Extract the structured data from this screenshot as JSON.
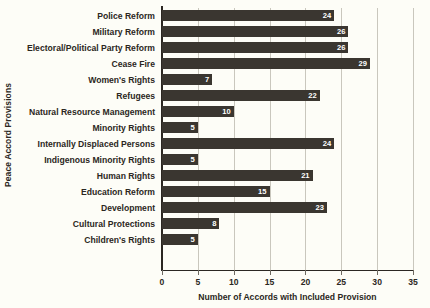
{
  "chart_data": {
    "type": "bar",
    "orientation": "horizontal",
    "title": "",
    "xlabel": "Number of Accords with Included Provision",
    "ylabel": "Peace Accord Provisions",
    "xlim": [
      0,
      35
    ],
    "xticks": [
      0,
      5,
      10,
      15,
      20,
      25,
      30,
      35
    ],
    "grid": true,
    "legend": false,
    "bar_color": "#3a3630",
    "background_color": "#fdfdf7",
    "value_label_color": "#ffffff",
    "categories": [
      "Police Reform",
      "Military Reform",
      "Electoral/Political Party Reform",
      "Cease Fire",
      "Women's Rights",
      "Refugees",
      "Natural Resource Management",
      "Minority Rights",
      "Internally Displaced Persons",
      "Indigenous Minority Rights",
      "Human Rights",
      "Education Reform",
      "Development",
      "Cultural Protections",
      "Children's Rights"
    ],
    "values": [
      24,
      26,
      26,
      29,
      7,
      22,
      10,
      5,
      24,
      5,
      21,
      15,
      23,
      8,
      5
    ]
  }
}
